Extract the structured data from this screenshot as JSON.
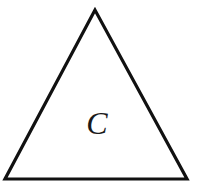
{
  "diagram": {
    "shape": "triangle",
    "type": "equilateral-like",
    "vertices": {
      "apex": [
        95,
        10
      ],
      "bottom_left": [
        5,
        179
      ],
      "bottom_right": [
        187,
        179
      ]
    },
    "stroke_color": "#111111",
    "stroke_width": 3.2,
    "fill": "#ffffff",
    "label": {
      "text": "C",
      "position": [
        97,
        134
      ]
    }
  }
}
